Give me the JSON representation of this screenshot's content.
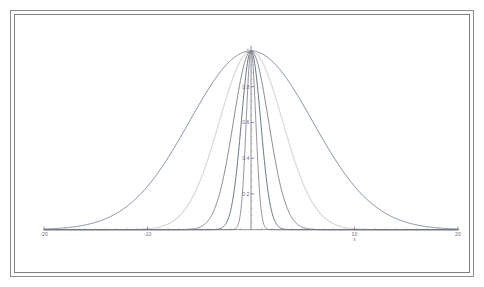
{
  "figure": {
    "background": "#ffffff",
    "frame_color": "#8d8d93"
  },
  "chart_data": {
    "type": "line",
    "title": "",
    "subtitle": "",
    "xlabel": "x",
    "ylabel": "",
    "xlim": [
      -20,
      20
    ],
    "ylim": [
      0,
      1.06
    ],
    "grid": false,
    "legend": "none",
    "annotations": [],
    "x_ticks": [
      -20,
      -10,
      0,
      10,
      20
    ],
    "x_tick_labels": [
      "-20",
      "-10",
      "",
      "10",
      "20"
    ],
    "y_ticks": [
      0.2,
      0.4,
      0.6,
      0.8,
      1.0
    ],
    "y_tick_labels": [
      "0.2",
      "0.4",
      "0.6",
      "0.8",
      "1"
    ],
    "y_minor_tick_step": 0.04,
    "x_minor_tick_step": 1,
    "peak_value": 1,
    "series": [
      {
        "name": "width-7.0",
        "half_width": 7.0,
        "color": "#6d7b91",
        "line_width": 0.9,
        "shape": "gaussian-peak-normalized"
      },
      {
        "name": "width-3.6",
        "half_width": 3.6,
        "color": "#d9d9d9",
        "line_width": 1.2,
        "shape": "gaussian-peak-normalized"
      },
      {
        "name": "width-2.0",
        "half_width": 2.0,
        "color": "#7c7c86",
        "line_width": 0.9,
        "shape": "gaussian-peak-normalized"
      },
      {
        "name": "width-1.1",
        "half_width": 1.1,
        "color": "#5b6a7e",
        "line_width": 0.9,
        "shape": "gaussian-peak-normalized"
      },
      {
        "name": "width-0.55",
        "half_width": 0.55,
        "color": "#8a8a93",
        "line_width": 0.9,
        "shape": "gaussian-peak-normalized"
      }
    ],
    "axis_color": "#70707a",
    "tick_color": "#8a8a93",
    "text_color": "#6f6f77"
  }
}
